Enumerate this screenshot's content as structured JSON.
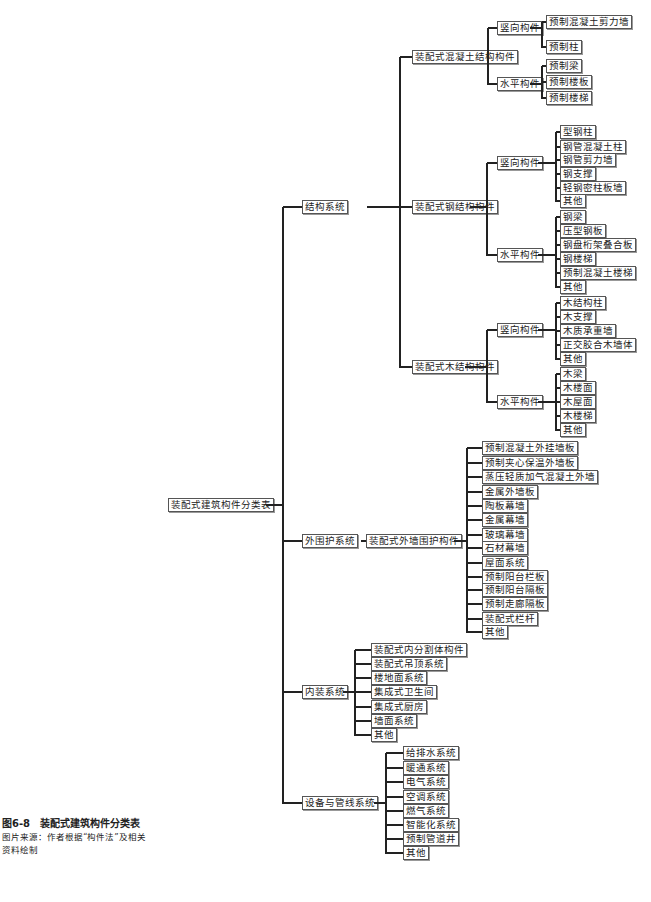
{
  "diagram": {
    "type": "tree",
    "root": {
      "label": "装配式建筑构件分类表",
      "children": [
        {
          "label": "结构系统",
          "children": [
            {
              "label": "装配式混凝土结构构件",
              "children": [
                {
                  "label": "竖向构件",
                  "children": [
                    "预制混凝土剪力墙",
                    "预制柱"
                  ]
                },
                {
                  "label": "水平构件",
                  "children": [
                    "预制梁",
                    "预制楼板",
                    "预制楼梯"
                  ]
                }
              ]
            },
            {
              "label": "装配式钢结构构件",
              "children": [
                {
                  "label": "竖向构件",
                  "children": [
                    "型钢柱",
                    "钢管混凝土柱",
                    "钢管剪力墙",
                    "钢支撑",
                    "轻钢密柱板墙",
                    "其他"
                  ]
                },
                {
                  "label": "水平构件",
                  "children": [
                    "钢梁",
                    "压型钢板",
                    "钢盘桁架叠合板",
                    "钢楼梯",
                    "预制混凝土楼梯",
                    "其他"
                  ]
                }
              ]
            },
            {
              "label": "装配式木结构构件",
              "children": [
                {
                  "label": "竖向构件",
                  "children": [
                    "木结构柱",
                    "木支撑",
                    "木质承重墙",
                    "正交胶合木墙体",
                    "其他"
                  ]
                },
                {
                  "label": "水平构件",
                  "children": [
                    "木梁",
                    "木楼面",
                    "木屋面",
                    "木楼梯",
                    "其他"
                  ]
                }
              ]
            }
          ]
        },
        {
          "label": "外围护系统",
          "children": [
            {
              "label": "装配式外墙围护构件",
              "children": [
                "预制混凝土外挂墙板",
                "预制夹心保温外墙板",
                "蒸压轻质加气混凝土外墙",
                "金属外墙板",
                "陶板幕墙",
                "金属幕墙",
                "玻璃幕墙",
                "石材幕墙",
                "屋面系统",
                "预制阳台栏板",
                "预制阳台隔板",
                "预制走廊隔板",
                "装配式栏杆",
                "其他"
              ]
            }
          ]
        },
        {
          "label": "内装系统",
          "children": [
            "装配式内分割体构件",
            "装配式吊顶系统",
            "楼地面系统",
            "集成式卫生间",
            "集成式厨房",
            "墙面系统",
            "其他"
          ]
        },
        {
          "label": "设备与管线系统",
          "children": [
            "给排水系统",
            "暖通系统",
            "电气系统",
            "空调系统",
            "燃气系统",
            "智能化系统",
            "预制管道井",
            "其他"
          ]
        }
      ]
    }
  },
  "caption": {
    "figure_title": "图6-8　装配式建筑构件分类表",
    "source_line1": "图片来源：作者根据“构件法”及相关",
    "source_line2": "资料绘制"
  },
  "colors": {
    "line": "#222222",
    "box_border": "#555555",
    "text": "#222222",
    "background": "#ffffff"
  }
}
